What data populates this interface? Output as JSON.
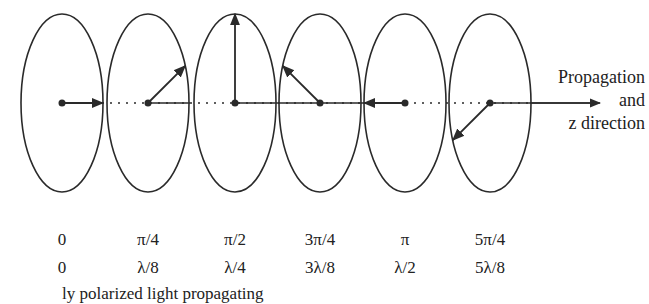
{
  "diagram": {
    "propagation_label": [
      "Propagation",
      "and",
      "z direction"
    ],
    "ink_color": "#2a2a2a",
    "ellipses": [
      {
        "cx": 62,
        "arrow_angle_deg": 0,
        "arrow": "right"
      },
      {
        "cx": 148,
        "arrow_angle_deg": 45,
        "arrow": "up-right"
      },
      {
        "cx": 235,
        "arrow_angle_deg": 90,
        "arrow": "up"
      },
      {
        "cx": 320,
        "arrow_angle_deg": 135,
        "arrow": "up-left"
      },
      {
        "cx": 405,
        "arrow_angle_deg": 180,
        "arrow": "left"
      },
      {
        "cx": 490,
        "arrow_angle_deg": 225,
        "arrow": "down-left"
      }
    ],
    "phase_labels": [
      "0",
      "π/4",
      "π/2",
      "3π/4",
      "π",
      "5π/4"
    ],
    "distance_labels": [
      "0",
      "λ/8",
      "λ/4",
      "3λ/8",
      "λ/2",
      "5λ/8"
    ],
    "caption_clipped": "ly polarized light propagating"
  }
}
